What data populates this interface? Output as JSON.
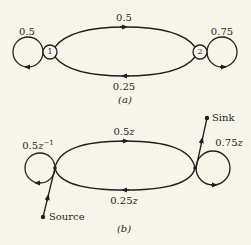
{
  "diagram_a": {
    "caption": "(a)",
    "nodes": [
      {
        "id": "1",
        "label": "1"
      },
      {
        "id": "2",
        "label": "2"
      }
    ],
    "edges": {
      "self_loop_1": "0.5",
      "one_to_two": "0.5",
      "two_to_one": "0.25",
      "self_loop_2": "0.75"
    }
  },
  "diagram_b": {
    "caption": "(b)",
    "edges": {
      "self_loop_left_coef": "0.5",
      "self_loop_left_var": "z",
      "self_loop_left_exp": "−1",
      "upper_coef": "0.5",
      "upper_var": "z",
      "lower_coef": "0.25",
      "lower_var": "z",
      "self_loop_right_coef": "0.75",
      "self_loop_right_var": "z"
    },
    "terminals": {
      "source": "Source",
      "sink": "Sink"
    }
  },
  "colors": {
    "background": "#f7f4ea",
    "ink": "#1f1f1f"
  }
}
